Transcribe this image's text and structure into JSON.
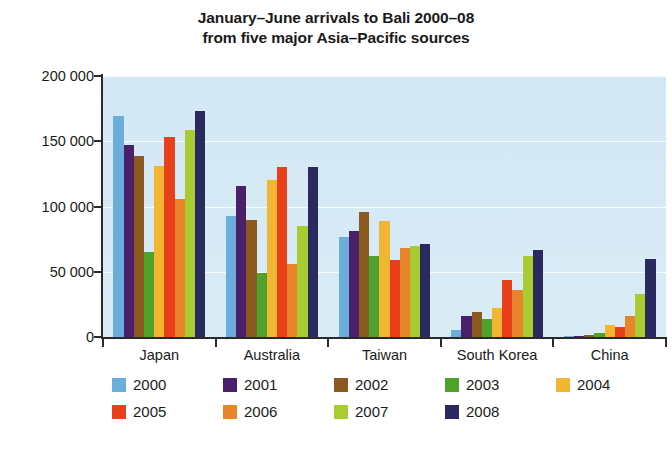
{
  "chart_data": {
    "type": "bar",
    "title": "January–June arrivals to Bali 2000–08 from five major Asia–Pacific sources",
    "title_line1": "January–June arrivals to Bali 2000–08",
    "title_line2": "from five major Asia–Pacific sources",
    "xlabel": "",
    "ylabel": "",
    "ylim": [
      0,
      200000
    ],
    "ytick_values": [
      0,
      50000,
      100000,
      150000,
      200000
    ],
    "ytick_labels": [
      "0",
      "50 000",
      "100 000",
      "150 000",
      "200 000"
    ],
    "grid": true,
    "legend_position": "bottom",
    "plot_background": "#d6eaf4",
    "categories": [
      "Japan",
      "Australia",
      "Taiwan",
      "South Korea",
      "China"
    ],
    "series": [
      {
        "name": "2000",
        "color": "#6BAEDB",
        "values": [
          169000,
          93000,
          77000,
          5000,
          1000
        ]
      },
      {
        "name": "2001",
        "color": "#4A206B",
        "values": [
          147000,
          116000,
          81000,
          16000,
          1000
        ]
      },
      {
        "name": "2002",
        "color": "#8B5A20",
        "values": [
          139000,
          90000,
          96000,
          19000,
          1500
        ]
      },
      {
        "name": "2003",
        "color": "#4FA32B",
        "values": [
          65000,
          49000,
          62000,
          14000,
          3000
        ]
      },
      {
        "name": "2004",
        "color": "#F2B632",
        "values": [
          131000,
          120000,
          89000,
          22000,
          9000
        ]
      },
      {
        "name": "2005",
        "color": "#E8401A",
        "values": [
          153000,
          130000,
          59000,
          44000,
          8000
        ]
      },
      {
        "name": "2006",
        "color": "#E8852A",
        "values": [
          106000,
          56000,
          68000,
          36000,
          16000
        ]
      },
      {
        "name": "2007",
        "color": "#AACC33",
        "values": [
          159000,
          85000,
          70000,
          62000,
          33000
        ]
      },
      {
        "name": "2008",
        "color": "#2A2A60",
        "values": [
          173000,
          130000,
          71000,
          67000,
          60000
        ]
      }
    ],
    "legend_entries": [
      {
        "label": "2000",
        "color": "#6BAEDB"
      },
      {
        "label": "2001",
        "color": "#4A206B"
      },
      {
        "label": "2002",
        "color": "#8B5A20"
      },
      {
        "label": "2003",
        "color": "#4FA32B"
      },
      {
        "label": "2004",
        "color": "#F2B632"
      },
      {
        "label": "2005",
        "color": "#E8401A"
      },
      {
        "label": "2006",
        "color": "#E8852A"
      },
      {
        "label": "2007",
        "color": "#AACC33"
      },
      {
        "label": "2008",
        "color": "#2A2A60"
      }
    ]
  }
}
